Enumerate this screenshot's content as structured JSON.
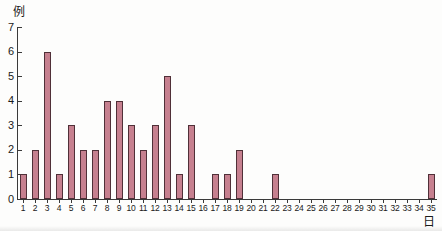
{
  "chart_data": {
    "type": "bar",
    "ylabel": "例",
    "xlabel": "日",
    "categories": [
      1,
      2,
      3,
      4,
      5,
      6,
      7,
      8,
      9,
      10,
      11,
      12,
      13,
      14,
      15,
      16,
      17,
      18,
      19,
      20,
      21,
      22,
      23,
      24,
      25,
      26,
      27,
      28,
      29,
      30,
      31,
      32,
      33,
      34,
      35
    ],
    "values": [
      1,
      2,
      6,
      1,
      3,
      2,
      2,
      4,
      4,
      3,
      2,
      3,
      5,
      1,
      3,
      0,
      1,
      1,
      2,
      0,
      0,
      1,
      0,
      0,
      0,
      0,
      0,
      0,
      0,
      0,
      0,
      0,
      0,
      0,
      1
    ],
    "ylim": [
      0,
      7
    ],
    "yticks": [
      0,
      1,
      2,
      3,
      4,
      5,
      6,
      7
    ],
    "grid": false,
    "legend": "none",
    "bar_color": "#c6808f",
    "bar_border_color": "#503038",
    "axis_color": "#3a3a3a",
    "text_color": "#1a1a1a"
  }
}
